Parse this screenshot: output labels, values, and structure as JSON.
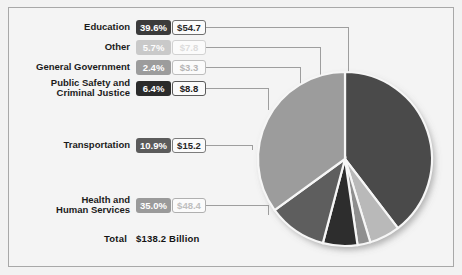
{
  "figure": {
    "total_label": "Total",
    "total_value": "$138.2 Billion",
    "background": "#f4f4f4",
    "frame_color": "#a8a8a8"
  },
  "chart_data": {
    "type": "pie",
    "title": "",
    "subtitle": "",
    "xlabel": "",
    "ylabel": "",
    "units": "Billions of dollars",
    "total": 138.2,
    "total_text": "$138.2 Billion",
    "legend_position": "left-callouts",
    "grid": false,
    "categories": [
      "Education",
      "Other",
      "General Government",
      "Public Safety and Criminal Justice",
      "Transportation",
      "Health and Human Services"
    ],
    "values": [
      54.7,
      7.8,
      3.3,
      8.8,
      15.2,
      48.4
    ],
    "percents": [
      39.6,
      5.7,
      2.4,
      6.4,
      10.9,
      35.0
    ],
    "percent_labels": [
      "39.6%",
      "5.7%",
      "2.4%",
      "6.4%",
      "10.9%",
      "35.0%"
    ],
    "value_labels": [
      "$54.7",
      "$7.8",
      "$3.3",
      "$8.8",
      "$15.2",
      "$48.4"
    ],
    "slice_colors": [
      "#4a4a4a",
      "#b9b9b9",
      "#8f8f8f",
      "#2d2d2d",
      "#5e5e5e",
      "#9c9c9c"
    ],
    "start_angle_deg": 0,
    "direction": "clockwise"
  },
  "rows": [
    {
      "name": "education",
      "title": "Education",
      "percent": "39.6%",
      "value": "$54.7",
      "pct_bg": "#3b3b3b",
      "pct_fg": "#ffffff",
      "amt_fg": "#2a2a2a",
      "amt_border": "#6f6f6f"
    },
    {
      "name": "other",
      "title": "Other",
      "percent": "5.7%",
      "value": "$7.8",
      "pct_bg": "#c9c9c9",
      "pct_fg": "#fdfdfd",
      "amt_fg": "#dcdcdc",
      "amt_border": "#d2d2d2"
    },
    {
      "name": "general-government",
      "title": "General Government",
      "percent": "2.4%",
      "value": "$3.3",
      "pct_bg": "#9c9c9c",
      "pct_fg": "#ffffff",
      "amt_fg": "#b4b4b4",
      "amt_border": "#bdbdbd"
    },
    {
      "name": "public-safety-and-criminal-justice",
      "title": "Public Safety and\nCriminal Justice",
      "percent": "6.4%",
      "value": "$8.8",
      "pct_bg": "#2b2b2b",
      "pct_fg": "#ffffff",
      "amt_fg": "#202020",
      "amt_border": "#5a5a5a"
    },
    {
      "name": "transportation",
      "title": "Transportation",
      "percent": "10.9%",
      "value": "$15.2",
      "pct_bg": "#5b5b5b",
      "pct_fg": "#ffffff",
      "amt_fg": "#262626",
      "amt_border": "#7c7c7c"
    },
    {
      "name": "health-and-human-services",
      "title": "Health and\nHuman Services",
      "percent": "35.0%",
      "value": "$48.4",
      "pct_bg": "#9a9a9a",
      "pct_fg": "#ffffff",
      "amt_fg": "#bfbfbf",
      "amt_border": "#b0b0b0"
    }
  ]
}
